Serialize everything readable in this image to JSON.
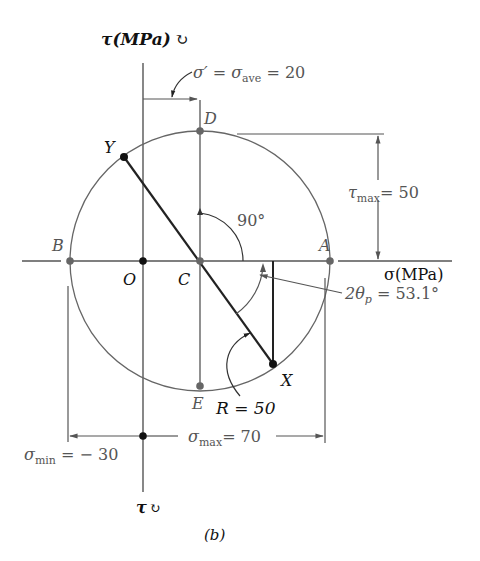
{
  "figure": {
    "caption": "(b)",
    "type": "Mohr's circle for plane stress",
    "axes": {
      "sigma_label": "σ(MPa)",
      "tau_label_top": "τ(MPa)",
      "tau_label_bottom": "τ"
    },
    "points": {
      "A": "A",
      "B": "B",
      "C": "C",
      "D": "D",
      "E": "E",
      "O": "O",
      "X": "X",
      "Y": "Y"
    },
    "annotations": {
      "sigma_ave": "σ′ = σave = 20",
      "sigma_ave_prefix": "σ′ = σ",
      "sigma_ave_sub": "ave",
      "sigma_ave_value": " = 20",
      "tau_max_sym": "τ",
      "tau_max_sub": "max",
      "tau_max_value": "= 50",
      "angle_90": "90°",
      "two_theta_p_prefix": "2θ",
      "two_theta_p_sub": "p",
      "two_theta_p_value": " = 53.1°",
      "radius": "R = 50",
      "sigma_max_sym": "σ",
      "sigma_max_sub": "max",
      "sigma_max_value": "= 70",
      "sigma_min_sym": "σ",
      "sigma_min_sub": "min",
      "sigma_min_value": " = − 30"
    },
    "values": {
      "sigma_ave_MPa": 20,
      "radius_MPa": 50,
      "tau_max_MPa": 50,
      "sigma_max_MPa": 70,
      "sigma_min_MPa": -30,
      "two_theta_p_deg": 53.1,
      "angle_CD_deg": 90
    },
    "colors": {
      "line": "#555555",
      "dark": "#111111",
      "point": "#666666"
    }
  }
}
